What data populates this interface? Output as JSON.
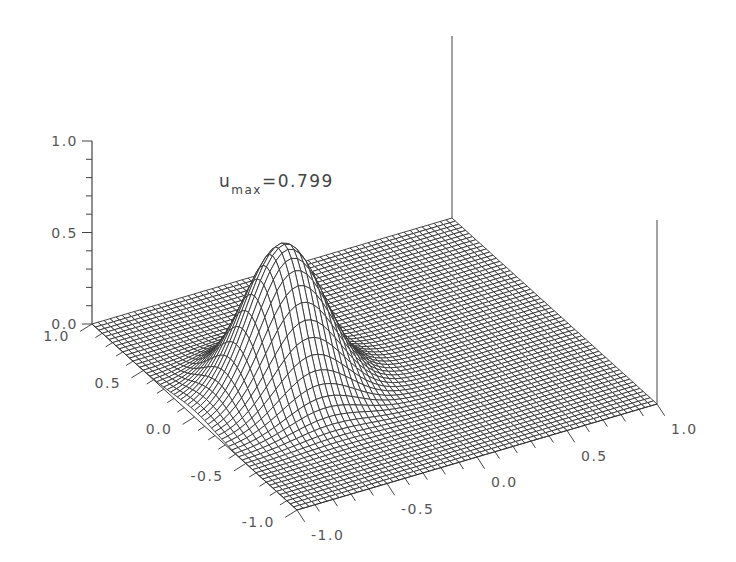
{
  "chart_data": {
    "type": "surface3d",
    "title": "",
    "annotation": {
      "symbol": "u",
      "subscript": "max",
      "text": "=0.799",
      "value": 0.799
    },
    "function": "gaussian bump",
    "peak": {
      "x": -0.5,
      "y": 0.0,
      "z": 0.799
    },
    "sigma": 0.2,
    "x_axis": {
      "label": "",
      "ticks": [
        "-1.0",
        "-0.5",
        "0.0",
        "0.5",
        "1.0"
      ],
      "range": [
        -1.0,
        1.0
      ]
    },
    "y_axis": {
      "label": "",
      "ticks": [
        "-1.0",
        "-0.5",
        "0.0",
        "0.5",
        "1.0"
      ],
      "range": [
        -1.0,
        1.0
      ]
    },
    "z_axis": {
      "label": "",
      "ticks": [
        "0.0",
        "0.5",
        "1.0"
      ],
      "range": [
        0.0,
        1.0
      ]
    },
    "grid_resolution": 60,
    "mesh_color": "#333333",
    "background": "#ffffff"
  },
  "annotation_label": "u",
  "annotation_sub": "max",
  "annotation_value": "=0.799"
}
